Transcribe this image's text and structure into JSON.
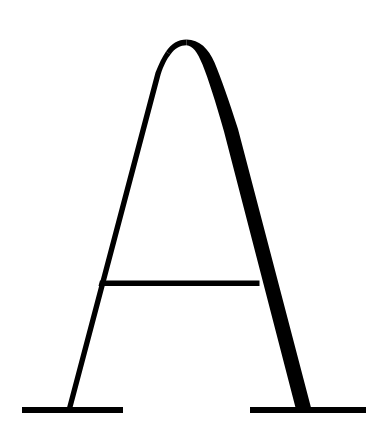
{
  "image": {
    "kind": "typographic-glyph-specimen",
    "character": "A",
    "script": "Latin",
    "case": "uppercase",
    "style_description": "Didone / modern serif capital A with rounded apex, hairline left stroke, heavy right stroke and flat slab foot serifs",
    "width": 386,
    "height": 435,
    "alt_text": "Black capital letter A on a white background"
  },
  "colors": {
    "background": "#ffffff",
    "ink": "#000000"
  },
  "geometry": {
    "apex": {
      "top_y": 38,
      "center_x": 186,
      "description": "rounded arched apex"
    },
    "left_stroke": {
      "name": "hairline-thin-stroke",
      "top_x": 166,
      "bottom_x": 69,
      "bottom_y": 409,
      "thickness_px": 3
    },
    "right_stroke": {
      "name": "heavy-thick-stroke",
      "top_x": 200,
      "bottom_x": 305,
      "bottom_y": 409,
      "thickness_px": 14
    },
    "crossbar": {
      "name": "horizontal-crossbar",
      "y": 283,
      "x_start": 100,
      "x_end": 259,
      "thickness_px": 5
    },
    "left_foot_serif": {
      "y": 410,
      "x_start": 22,
      "x_end": 123,
      "thickness_px": 6
    },
    "right_foot_serif": {
      "y": 410,
      "x_start": 250,
      "x_end": 366,
      "thickness_px": 6
    }
  }
}
